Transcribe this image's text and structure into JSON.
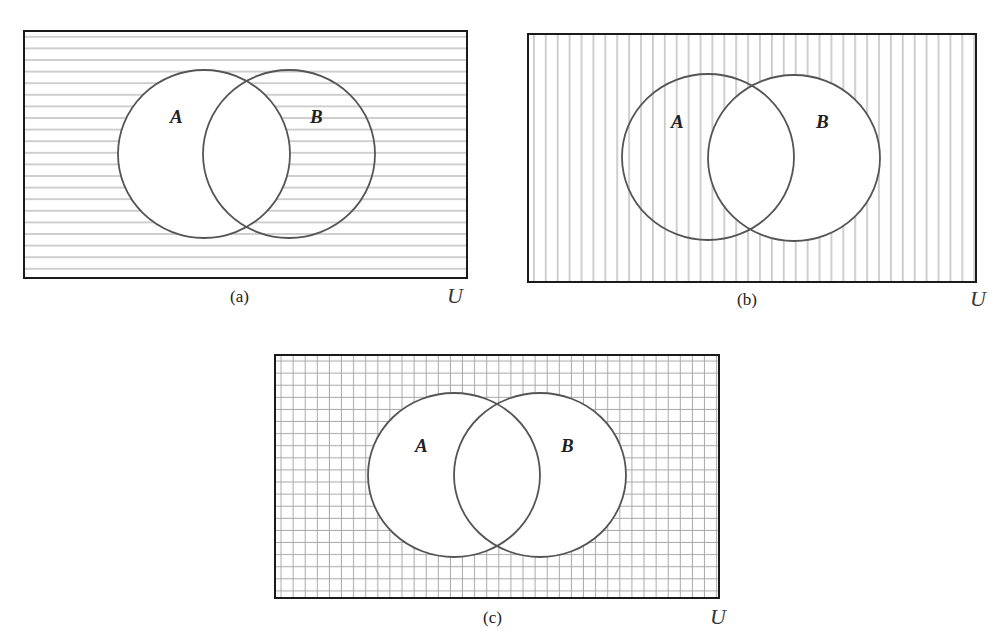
{
  "figure": {
    "line_color": "#a8a8a8",
    "stroke_color": "#555555",
    "border_color": "#1a1a1a",
    "panels": [
      {
        "id": "a",
        "caption": "(a)",
        "universe_label": "U",
        "shading": "horizontal",
        "shaded_region": "complement of A",
        "sets": [
          {
            "label": "A",
            "shaded": false
          },
          {
            "label": "B",
            "shaded": true
          }
        ]
      },
      {
        "id": "b",
        "caption": "(b)",
        "universe_label": "U",
        "shading": "vertical",
        "shaded_region": "complement of B",
        "sets": [
          {
            "label": "A",
            "shaded": true
          },
          {
            "label": "B",
            "shaded": false
          }
        ]
      },
      {
        "id": "c",
        "caption": "(c)",
        "universe_label": "U",
        "shading": "grid",
        "shaded_region": "complement of A union B",
        "sets": [
          {
            "label": "A",
            "shaded": false
          },
          {
            "label": "B",
            "shaded": false
          }
        ]
      }
    ]
  }
}
